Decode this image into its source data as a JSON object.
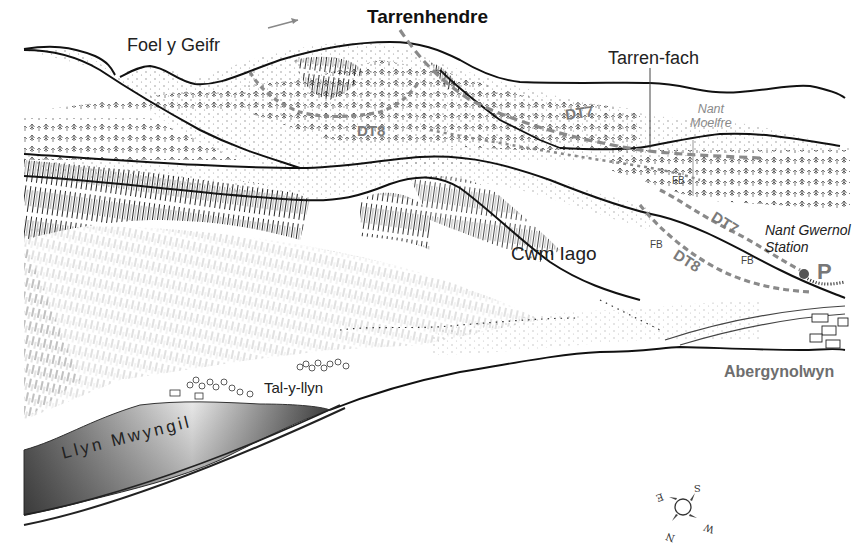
{
  "map": {
    "title": "Tarrenhendre",
    "peaks": {
      "foel_y_geifr": "Foel y Geifr",
      "tarren_fach": "Tarren-fach"
    },
    "routes": {
      "dt7_upper": "DT7",
      "dt8_upper": "DT8",
      "dt7_lower": "DT7",
      "dt8_lower": "DT8"
    },
    "streams": {
      "nant_moelfre": [
        "Nant",
        "Moelfre"
      ]
    },
    "footbridges": [
      "FB",
      "FB",
      "FB"
    ],
    "places": {
      "cwm_iago": "Cwm Iago",
      "tal_y_llyn": "Tal-y-llyn",
      "abergynolwyn": "Abergynolwyn",
      "lake": "Llyn Mwyngil"
    },
    "station": [
      "Nant Gwernol",
      "Station"
    ],
    "parking": "P",
    "compass": {
      "n": "N",
      "s": "S",
      "e": "E",
      "w": "W"
    },
    "colors": {
      "ink": "#111111",
      "route_grey": "#8a8a8a",
      "label_grey": "#6e6e6e",
      "lake_dark": "#4a4a4a",
      "lake_light": "#f2f2f2",
      "station_dot": "#555555"
    }
  }
}
